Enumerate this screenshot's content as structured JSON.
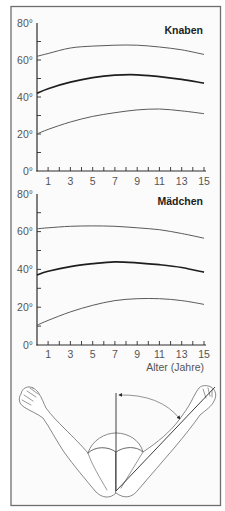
{
  "figure": {
    "panels": [
      {
        "title": "Knaben"
      },
      {
        "title": "Mädchen",
        "xlabel": "Alter (Jahre)"
      }
    ],
    "illustration": {
      "icon": "arms-elbow-angle-illustration"
    }
  },
  "colors": {
    "mean_line": "#1e1e1e",
    "range_line": "#5a5a5a",
    "axis": "#2e2e2e",
    "frame": "#6e6e6e",
    "tick_label": "#555555"
  },
  "chart_data": [
    {
      "type": "line",
      "title": "Knaben",
      "xlabel": "",
      "ylabel": "",
      "xlim": [
        0,
        15
      ],
      "ylim": [
        0,
        80
      ],
      "grid": false,
      "legend": null,
      "y_tick_labels": [
        "80°",
        "60°",
        "40°",
        "20°",
        "0°"
      ],
      "x_tick_labels": [
        "1",
        "3",
        "5",
        "7",
        "9",
        "11",
        "13",
        "15"
      ],
      "x": [
        0,
        1,
        3,
        5,
        7,
        9,
        11,
        13,
        15
      ],
      "series": [
        {
          "name": "upper",
          "values": [
            62,
            63.5,
            66.5,
            67.5,
            68,
            68,
            67,
            65.5,
            63
          ]
        },
        {
          "name": "mean",
          "values": [
            42,
            44.5,
            48,
            50.5,
            51.8,
            52,
            51,
            49.5,
            47.5
          ]
        },
        {
          "name": "lower",
          "values": [
            20,
            22.5,
            26.5,
            29.5,
            31.5,
            33,
            33.5,
            32.5,
            31
          ]
        }
      ]
    },
    {
      "type": "line",
      "title": "Mädchen",
      "xlabel": "Alter (Jahre)",
      "ylabel": "",
      "xlim": [
        0,
        15
      ],
      "ylim": [
        0,
        80
      ],
      "grid": false,
      "legend": null,
      "y_tick_labels": [
        "80°",
        "60°",
        "40°",
        "20°",
        "0°"
      ],
      "x_tick_labels": [
        "1",
        "3",
        "5",
        "7",
        "9",
        "11",
        "13",
        "15"
      ],
      "x": [
        0,
        1,
        3,
        5,
        7,
        9,
        11,
        13,
        15
      ],
      "series": [
        {
          "name": "upper",
          "values": [
            61.5,
            62,
            62.8,
            63,
            62.8,
            62,
            61,
            59,
            56.5
          ]
        },
        {
          "name": "mean",
          "values": [
            37,
            39,
            41.5,
            43,
            44,
            43.5,
            42.5,
            41,
            38.5
          ]
        },
        {
          "name": "lower",
          "values": [
            10.5,
            13,
            17.5,
            21,
            23.5,
            24.5,
            24.5,
            23.5,
            21.5
          ]
        }
      ]
    }
  ]
}
